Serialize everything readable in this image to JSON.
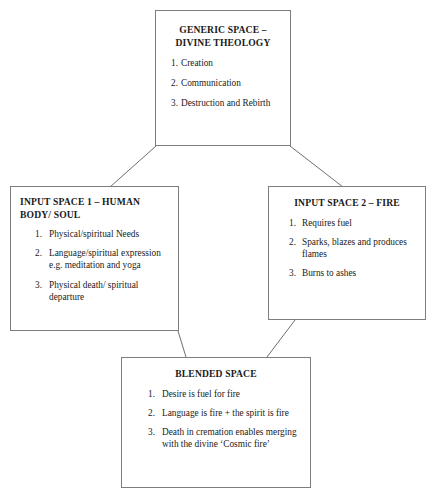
{
  "diagram": {
    "background_color": "#ffffff",
    "border_color": "#7d7d7d",
    "text_color": "#1a1a1a",
    "nodes": {
      "generic": {
        "title_line1": "GENERIC SPACE –",
        "title_line2": "DIVINE THEOLOGY",
        "items": [
          {
            "num": "1.",
            "text": "Creation"
          },
          {
            "num": "2.",
            "text": "Communication"
          },
          {
            "num": "3.",
            "text": "Destruction and Rebirth"
          }
        ]
      },
      "input1": {
        "title": "INPUT SPACE 1 – HUMAN BODY/ SOUL",
        "items": [
          {
            "num": "1.",
            "text": "Physical/spiritual Needs"
          },
          {
            "num": "2.",
            "text": "Language/spiritual expression e.g. meditation and yoga"
          },
          {
            "num": "3.",
            "text": "Physical death/ spiritual departure"
          }
        ]
      },
      "input2": {
        "title": "INPUT SPACE 2 – FIRE",
        "items": [
          {
            "num": "1.",
            "text": "Requires fuel"
          },
          {
            "num": "2.",
            "text": "Sparks, blazes and produces flames"
          },
          {
            "num": "3.",
            "text": "Burns to ashes"
          }
        ]
      },
      "blended": {
        "title": "BLENDED SPACE",
        "items": [
          {
            "num": "1.",
            "text": "Desire is fuel for fire"
          },
          {
            "num": "2.",
            "text": "Language is fire + the spirit is fire"
          },
          {
            "num": "3.",
            "text": "Death in cremation enables merging with the divine ‘Cosmic fire’"
          }
        ]
      }
    },
    "connectors": [
      {
        "name": "generic-to-input1",
        "x1": 156,
        "y1": 146,
        "x2": 110,
        "y2": 187
      },
      {
        "name": "generic-to-input2",
        "x1": 290,
        "y1": 146,
        "x2": 343,
        "y2": 187
      },
      {
        "name": "input1-to-blended",
        "x1": 178,
        "y1": 331,
        "x2": 186,
        "y2": 357
      },
      {
        "name": "input2-to-blended",
        "x1": 295,
        "y1": 320,
        "x2": 267,
        "y2": 357
      }
    ]
  }
}
